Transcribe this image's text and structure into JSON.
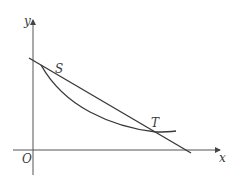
{
  "figure": {
    "axes": {
      "x_label": "x",
      "y_label": "y",
      "origin_label": "O"
    },
    "points": [
      {
        "name": "S",
        "label": "S"
      },
      {
        "name": "T",
        "label": "T"
      }
    ],
    "elements": [
      {
        "type": "straight-line",
        "passes_through": [
          "S",
          "T"
        ]
      },
      {
        "type": "curve",
        "passes_through": [
          "S",
          "T"
        ]
      }
    ],
    "colors": {
      "stroke": "#3a3a3a",
      "axis": "#555555",
      "background": "#ffffff"
    }
  }
}
